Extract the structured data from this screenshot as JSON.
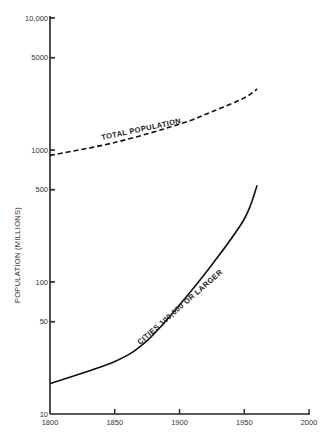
{
  "chart_data": {
    "type": "line",
    "title": "",
    "xlabel": "",
    "ylabel": "POPULATION (MILLIONS)",
    "yscale": "log",
    "xlim": [
      1800,
      2000
    ],
    "ylim": [
      10,
      10000
    ],
    "grid": false,
    "legend": "inline labels",
    "x_ticks": [
      "1800",
      "1850",
      "1900",
      "1950",
      "2000"
    ],
    "y_ticks": [
      "10",
      "50",
      "100",
      "500",
      "1000",
      "5000",
      "10,000"
    ],
    "series": [
      {
        "name": "TOTAL POPULATION",
        "style": "dashed",
        "x": [
          1800,
          1850,
          1900,
          1925,
          1950,
          1960
        ],
        "values": [
          910,
          1140,
          1570,
          1950,
          2480,
          2900
        ]
      },
      {
        "name": "CITIES 100,000 OR LARGER",
        "style": "solid",
        "x": [
          1800,
          1850,
          1875,
          1900,
          1925,
          1950,
          1960
        ],
        "values": [
          17,
          25,
          36,
          67,
          135,
          300,
          540
        ]
      }
    ]
  }
}
